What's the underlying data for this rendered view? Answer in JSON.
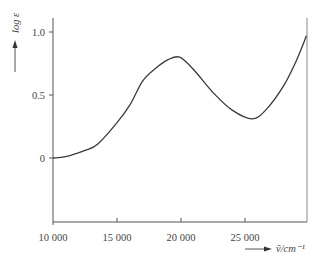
{
  "chart_data": {
    "type": "line",
    "title": "",
    "xlabel": "ṽ/cm⁻¹",
    "ylabel": "log ε",
    "xlim": [
      10000,
      29850
    ],
    "ylim": [
      -0.5,
      1.15
    ],
    "x_ticks": [
      10000,
      15000,
      20000,
      25000
    ],
    "x_tick_labels": [
      "10 000",
      "15 000",
      "20 000",
      "25 000"
    ],
    "y_ticks": [
      0,
      0.5,
      1.0
    ],
    "y_tick_labels": [
      "0",
      "0.5",
      "1.0"
    ],
    "grid": false,
    "legend": null,
    "series": [
      {
        "name": "absorption spectrum",
        "x": [
          10000,
          11000,
          12500,
          13500,
          15000,
          16000,
          17000,
          18000,
          19000,
          19900,
          21000,
          22500,
          24000,
          25600,
          26700,
          28000,
          29000,
          29800
        ],
        "y": [
          0.0,
          0.01,
          0.06,
          0.11,
          0.28,
          0.42,
          0.61,
          0.71,
          0.78,
          0.8,
          0.7,
          0.52,
          0.38,
          0.31,
          0.39,
          0.57,
          0.77,
          0.97
        ]
      }
    ]
  }
}
